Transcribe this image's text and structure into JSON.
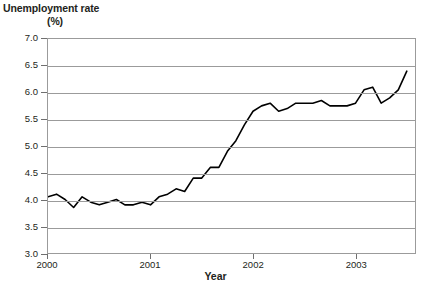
{
  "chart_data": {
    "type": "line",
    "title": "",
    "ylabel": "Unemployment rate",
    "ylabel_units": "(%)",
    "xlabel": "Year",
    "ylim": [
      3.0,
      7.0
    ],
    "ytick_step": 0.5,
    "yticks": [
      "3.0",
      "3.5",
      "4.0",
      "4.5",
      "5.0",
      "5.5",
      "6.0",
      "6.5",
      "7.0"
    ],
    "ytick_values": [
      3.0,
      3.5,
      4.0,
      4.5,
      5.0,
      5.5,
      6.0,
      6.5,
      7.0
    ],
    "xticks": [
      "2000",
      "2001",
      "2002",
      "2003"
    ],
    "xtick_values": [
      2000,
      2001,
      2002,
      2003
    ],
    "xlim": [
      2000.0,
      2003.58
    ],
    "grid": true,
    "grid_axis": "y",
    "legend": false,
    "line_color": "#000000",
    "grid_color": "#9b9b9b",
    "plot_background": "#ffffff",
    "series": [
      {
        "name": "Unemployment rate",
        "x": [
          2000.0,
          2000.083,
          2000.167,
          2000.25,
          2000.333,
          2000.417,
          2000.5,
          2000.583,
          2000.667,
          2000.75,
          2000.833,
          2000.917,
          2001.0,
          2001.083,
          2001.167,
          2001.25,
          2001.333,
          2001.417,
          2001.5,
          2001.583,
          2001.667,
          2001.75,
          2001.833,
          2001.917,
          2002.0,
          2002.083,
          2002.167,
          2002.25,
          2002.333,
          2002.417,
          2002.5,
          2002.583,
          2002.667,
          2002.75,
          2002.833,
          2002.917,
          2003.0,
          2003.083,
          2003.167,
          2003.25,
          2003.333,
          2003.417,
          2003.5
        ],
        "values": [
          4.05,
          4.1,
          4.0,
          3.85,
          4.05,
          3.95,
          3.9,
          3.95,
          4.0,
          3.9,
          3.9,
          3.95,
          3.9,
          4.05,
          4.1,
          4.2,
          4.15,
          4.4,
          4.4,
          4.6,
          4.6,
          4.9,
          5.1,
          5.4,
          5.65,
          5.75,
          5.8,
          5.65,
          5.7,
          5.8,
          5.8,
          5.8,
          5.85,
          5.75,
          5.75,
          5.75,
          5.8,
          6.05,
          6.1,
          5.8,
          5.9,
          6.05,
          6.4
        ],
        "labels": [
          "Jan 2000",
          "Feb 2000",
          "Mar 2000",
          "Apr 2000",
          "May 2000",
          "Jun 2000",
          "Jul 2000",
          "Aug 2000",
          "Sep 2000",
          "Oct 2000",
          "Nov 2000",
          "Dec 2000",
          "Jan 2001",
          "Feb 2001",
          "Mar 2001",
          "Apr 2001",
          "May 2001",
          "Jun 2001",
          "Jul 2001",
          "Aug 2001",
          "Sep 2001",
          "Oct 2001",
          "Nov 2001",
          "Dec 2001",
          "Jan 2002",
          "Feb 2002",
          "Mar 2002",
          "Apr 2002",
          "May 2002",
          "Jun 2002",
          "Jul 2002",
          "Aug 2002",
          "Sep 2002",
          "Oct 2002",
          "Nov 2002",
          "Dec 2002",
          "Jan 2003",
          "Feb 2003",
          "Mar 2003",
          "Apr 2003",
          "May 2003",
          "Jun 2003",
          "Jul 2003"
        ]
      }
    ]
  }
}
